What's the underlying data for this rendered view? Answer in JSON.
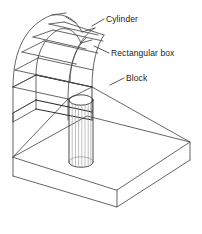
{
  "figure": {
    "kind": "isometric-wireframe-technical-drawing",
    "background_color": "#ffffff",
    "line_color": "#4a4a4a",
    "line_color_dark": "#2b2b2b",
    "label_color": "#1a1a1a",
    "callouts": [
      {
        "id": "cylinder",
        "label": "Cylinder"
      },
      {
        "id": "rectangular-box",
        "label": "Rectangular box"
      },
      {
        "id": "block",
        "label": "Block"
      }
    ],
    "parts": [
      {
        "id": "arch-shell",
        "name": "Cylinder"
      },
      {
        "id": "rect-box",
        "name": "Rectangular box"
      },
      {
        "id": "base-block",
        "name": "Block"
      },
      {
        "id": "vertical-cylinder",
        "name": "Cylinder"
      }
    ]
  }
}
